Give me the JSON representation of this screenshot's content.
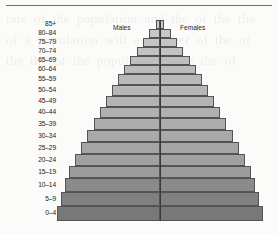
{
  "figure": {
    "top_rule": true,
    "background_note": "faint show-through text from the reverse side of the printed page",
    "ghost_text": "rate of the population and the of the the of a population will a number of the of the the of the population of in the of"
  },
  "legend": {
    "males_label": "Males",
    "females_label": "Females"
  },
  "chart_data": {
    "type": "bar",
    "subtype": "population-pyramid",
    "title": "",
    "xlabel": "",
    "ylabel": "",
    "orientation": "horizontal-diverging",
    "grid": false,
    "legend_position": "top-inside",
    "center_axis_value": 0,
    "categories": [
      "85+",
      "80-84",
      "75-79",
      "70-74",
      "65-69",
      "60-64",
      "55-59",
      "50-54",
      "45-49",
      "40-44",
      "35-39",
      "30-34",
      "25-29",
      "20-24",
      "15-19",
      "10-14",
      "5-9",
      "0-4"
    ],
    "series": [
      {
        "name": "Males",
        "side": "left",
        "values": [
          4,
          11,
          17,
          23,
          30,
          36,
          42,
          48,
          54,
          60,
          66,
          73,
          79,
          85,
          91,
          95,
          99,
          103
        ]
      },
      {
        "name": "Females",
        "side": "right",
        "values": [
          4,
          11,
          17,
          23,
          30,
          36,
          42,
          48,
          54,
          60,
          66,
          73,
          79,
          85,
          91,
          95,
          99,
          103
        ]
      }
    ],
    "value_units": "relative population width (px from centre)",
    "row_fill_colors": [
      "#c9c9c9",
      "#c7c7c7",
      "#c5c5c5",
      "#c2c2c2",
      "#bfbfbf",
      "#bcbcbc",
      "#b9b9b9",
      "#b6b6b6",
      "#b3b3b3",
      "#b0b0b0",
      "#adadad",
      "#a9a9a9",
      "#a5a5a5",
      "#a1a1a1",
      "#9c9c9c",
      "#8a8a8a",
      "#808080",
      "#787878"
    ],
    "row_heights_px": [
      9,
      9,
      9,
      9,
      9,
      9,
      11,
      11,
      11,
      11,
      12,
      12,
      12,
      12,
      12,
      14,
      14,
      15
    ],
    "axis_range_px": [
      -110,
      110
    ]
  },
  "colors": {
    "outline": "#545454",
    "center_line": "#3a3a3a",
    "top_rule": "#6f6f6f",
    "text": "#1a1a1a",
    "page_background": "#fbfbfa"
  }
}
